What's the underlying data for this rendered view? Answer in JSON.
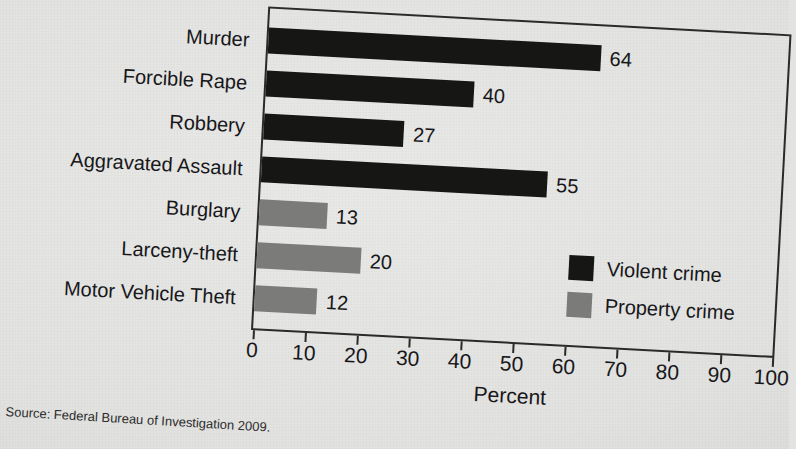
{
  "chart_data": {
    "type": "bar",
    "orientation": "horizontal",
    "title": "",
    "xlabel": "Percent",
    "ylabel": "",
    "xlim": [
      0,
      100
    ],
    "xticks": [
      "0",
      "10",
      "20",
      "30",
      "40",
      "50",
      "60",
      "70",
      "80",
      "90",
      "100"
    ],
    "grid": false,
    "legend_position": "inside-bottom-right",
    "categories": [
      "Murder",
      "Forcible Rape",
      "Robbery",
      "Aggravated Assault",
      "Burglary",
      "Larceny-theft",
      "Motor Vehicle Theft"
    ],
    "values": [
      64,
      40,
      27,
      55,
      13,
      20,
      12
    ],
    "groups": [
      "Violent crime",
      "Violent crime",
      "Violent crime",
      "Violent crime",
      "Property crime",
      "Property crime",
      "Property crime"
    ],
    "series": [
      {
        "name": "Violent crime",
        "color": "#161614",
        "points": [
          {
            "category": "Murder",
            "value": 64
          },
          {
            "category": "Forcible Rape",
            "value": 40
          },
          {
            "category": "Robbery",
            "value": 27
          },
          {
            "category": "Aggravated Assault",
            "value": 55
          }
        ]
      },
      {
        "name": "Property crime",
        "color": "#7b7b79",
        "points": [
          {
            "category": "Burglary",
            "value": 13
          },
          {
            "category": "Larceny-theft",
            "value": 20
          },
          {
            "category": "Motor Vehicle Theft",
            "value": 12
          }
        ]
      }
    ],
    "legend": [
      {
        "label": "Violent crime",
        "color": "#161614"
      },
      {
        "label": "Property crime",
        "color": "#7b7b79"
      }
    ],
    "annotations": {
      "source": "Source: Federal Bureau of Investigation 2009."
    }
  },
  "colors": {
    "violent_crime": "#161614",
    "property_crime": "#7b7b79",
    "axis": "#2a2a28",
    "text": "#17171a",
    "paper": "#e3e3e1"
  }
}
